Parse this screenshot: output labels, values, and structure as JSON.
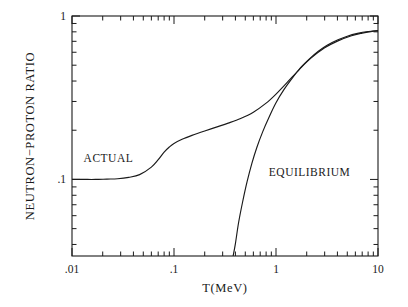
{
  "chart_data": {
    "type": "line",
    "title": "",
    "xlabel": "T(MeV)",
    "ylabel": "NEUTRON−PROTON RATIO",
    "xscale": "log",
    "yscale": "log",
    "xlim": [
      0.01,
      10
    ],
    "ylim": [
      0.034,
      1.0
    ],
    "grid": false,
    "legend_position": "inline-annotations",
    "xticklabels": [
      ".01",
      ".1",
      "1",
      "10"
    ],
    "xtickvalues": [
      0.01,
      0.1,
      1,
      10
    ],
    "yticklabels": [
      "1",
      ".1"
    ],
    "ytickvalues": [
      1,
      0.1
    ],
    "annotations": [
      {
        "text": "ACTUAL",
        "x": 0.013,
        "y": 0.128
      },
      {
        "text": "EQUILIBRIUM",
        "x": 0.85,
        "y": 0.105
      }
    ],
    "series": [
      {
        "name": "ACTUAL",
        "x": [
          0.01,
          0.013,
          0.017,
          0.022,
          0.028,
          0.036,
          0.046,
          0.06,
          0.07,
          0.08,
          0.09,
          0.1,
          0.12,
          0.15,
          0.2,
          0.26,
          0.34,
          0.45,
          0.6,
          0.8,
          1.0,
          1.3,
          1.7,
          2.2,
          3.0,
          4.0,
          5.5,
          7.0,
          8.5,
          10.0
        ],
        "y": [
          0.1,
          0.1,
          0.1,
          0.1005,
          0.101,
          0.103,
          0.107,
          0.119,
          0.132,
          0.147,
          0.158,
          0.166,
          0.176,
          0.186,
          0.198,
          0.209,
          0.221,
          0.236,
          0.258,
          0.293,
          0.333,
          0.395,
          0.472,
          0.552,
          0.639,
          0.702,
          0.757,
          0.786,
          0.803,
          0.812
        ]
      },
      {
        "name": "EQUILIBRIUM",
        "x": [
          0.38,
          0.4,
          0.43,
          0.47,
          0.52,
          0.58,
          0.65,
          0.74,
          0.85,
          1.0,
          1.2,
          1.45,
          1.75,
          2.1,
          2.6,
          3.2,
          4.0,
          5.0,
          6.3,
          8.0,
          10.0
        ],
        "y": [
          0.034,
          0.0405,
          0.0545,
          0.0725,
          0.0965,
          0.1255,
          0.1575,
          0.1955,
          0.2385,
          0.2945,
          0.3555,
          0.4185,
          0.4845,
          0.5425,
          0.6085,
          0.6645,
          0.7125,
          0.7525,
          0.7825,
          0.8035,
          0.8145
        ]
      }
    ]
  },
  "figure": {
    "frame_color": "#1a1a1a",
    "curve_color": "#1a1a1a",
    "background": "#ffffff"
  }
}
